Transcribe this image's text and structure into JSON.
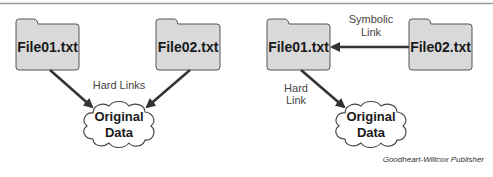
{
  "colors": {
    "folder_fill": "#d9d9d9",
    "folder_stroke": "#555555",
    "arrow": "#333333",
    "rule": "#999999"
  },
  "left_diagram": {
    "file1": "File01.txt",
    "file2": "File02.txt",
    "link_label": "Hard Links",
    "cloud_line1": "Original",
    "cloud_line2": "Data"
  },
  "right_diagram": {
    "file1": "File01.txt",
    "file2": "File02.txt",
    "symlink_label_line1": "Symbolic",
    "symlink_label_line2": "Link",
    "hardlink_label_line1": "Hard",
    "hardlink_label_line2": "Link",
    "cloud_line1": "Original",
    "cloud_line2": "Data"
  },
  "credit": "Goodheart-Willcox Publisher"
}
